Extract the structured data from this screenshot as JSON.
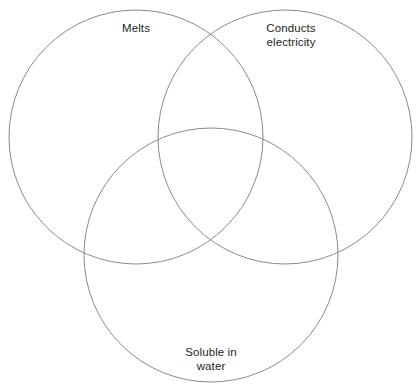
{
  "diagram": {
    "type": "venn-3-circle",
    "title": "",
    "background_color": "#ffffff",
    "stroke_color": "#8a8a8a",
    "stroke_width": 1,
    "text_color": "#231f20",
    "width": 420,
    "height": 389,
    "circles": [
      {
        "id": "melts",
        "label": "Melts",
        "label_lines": [
          "Melts"
        ],
        "cx": 136,
        "cy": 137,
        "r": 127
      },
      {
        "id": "conducts-electricity",
        "label": "Conducts electricity",
        "label_lines": [
          "Conducts",
          "electricity"
        ],
        "cx": 285,
        "cy": 137,
        "r": 127
      },
      {
        "id": "soluble-in-water",
        "label": "Soluble in water",
        "label_lines": [
          "Soluble in",
          "water"
        ],
        "cx": 211,
        "cy": 255,
        "r": 127
      }
    ],
    "labels": {
      "melts": "Melts",
      "conducts": "Conducts\nelectricity",
      "soluble": "Soluble in\nwater"
    }
  }
}
